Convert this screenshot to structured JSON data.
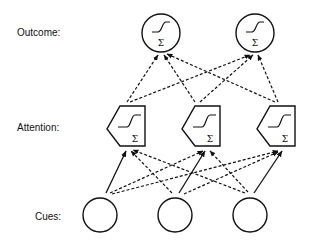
{
  "labels": {
    "outcome": "Outcome:",
    "attention": "Attention:",
    "cues": "Cues:"
  },
  "node_symbol": "Σ",
  "layers": {
    "outcome": {
      "count": 2,
      "shape": "circle",
      "contents": [
        "sigmoid-icon",
        "sum-icon"
      ]
    },
    "attention": {
      "count": 3,
      "shape": "pentagon",
      "contents": [
        "sigmoid-icon",
        "sum-icon"
      ]
    },
    "cues": {
      "count": 3,
      "shape": "circle",
      "contents": []
    }
  },
  "connections": {
    "cues_to_attention": {
      "solid": "same-index",
      "dashed": "all-other"
    },
    "attention_to_outcome": {
      "style": "dashed",
      "pattern": "all-to-all"
    }
  }
}
